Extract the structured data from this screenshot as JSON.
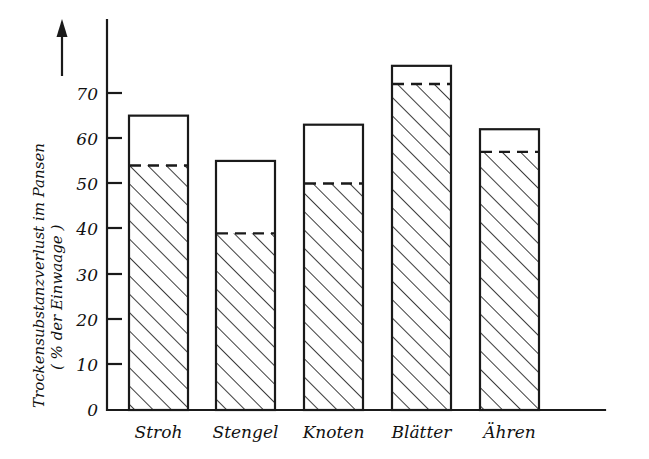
{
  "chart_data": {
    "type": "bar",
    "title": "",
    "subtitle": "",
    "xlabel": "",
    "ylabel": "Trockensubstanzverlust im Pansen ( % der Einwaage )",
    "ylabel_line1": "Trockensubstanzverlust im Pansen",
    "ylabel_line2": "( % der Einwaage )",
    "categories": [
      "Stroh",
      "Stengel",
      "Knoten",
      "Blätter",
      "Ähren"
    ],
    "series": [
      {
        "name": "hatched-lower-portion",
        "values": [
          54,
          39,
          50,
          72,
          57
        ]
      },
      {
        "name": "total-bar-height",
        "values": [
          65,
          55,
          63,
          76,
          62
        ]
      }
    ],
    "values": [
      65,
      55,
      63,
      76,
      62
    ],
    "ylim": [
      0,
      78
    ],
    "yticks": [
      0,
      10,
      20,
      30,
      40,
      50,
      60,
      70
    ],
    "ytick_labels": [
      "0",
      "10",
      "20",
      "30",
      "40",
      "50",
      "60",
      "70"
    ],
    "grid": false,
    "legend": "none",
    "annotations": [
      {
        "name": "y-axis-up-arrow",
        "description": "upward arrow beside axis title"
      }
    ],
    "bar_style": {
      "fill": "none",
      "outline_color": "#1a1a1a",
      "hatch": "diagonal-45-up",
      "divider": "dashed"
    }
  },
  "axis": {
    "y_tick_labels": [
      "70",
      "60",
      "50",
      "40",
      "30",
      "20",
      "10",
      "0"
    ],
    "x_tick_labels": [
      "Stroh",
      "Stengel",
      "Knoten",
      "Blätter",
      "Ähren"
    ],
    "y_title_line1": "Trockensubstanzverlust im Pansen",
    "y_title_line2": "( % der Einwaage )"
  },
  "colors": {
    "ink": "#1a1a1a",
    "background": "#ffffff"
  }
}
